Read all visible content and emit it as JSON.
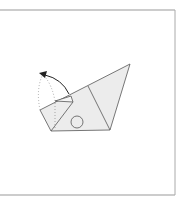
{
  "diagram": {
    "type": "origami-fold-step",
    "colors": {
      "paper_fill": "#ececec",
      "line": "#555555",
      "frame": "#999999",
      "arrow": "#222222",
      "dotted": "#888888"
    },
    "frame": {
      "top_y": 10,
      "bottom_y": 195,
      "right_x": 175
    },
    "shapes": {
      "main_polygon": "51,131 88,112 130,64 110,130",
      "left_flap": "40,110 73,101 51,131",
      "small_fold": "55,101 73,96 72,102",
      "inner_line": "88,86 110,130",
      "circle": {
        "cx": 77,
        "cy": 122,
        "r": 6
      }
    },
    "arrow": {
      "path": "M68,95 Q62,78 42,74",
      "head": "38,73 46,70 44,77"
    }
  }
}
